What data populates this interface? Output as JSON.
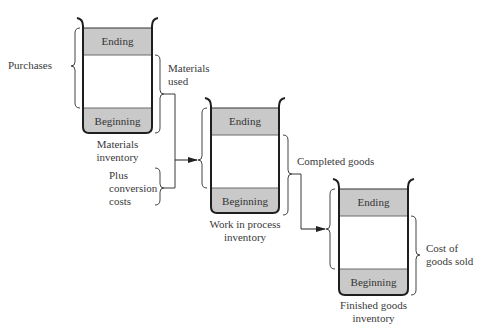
{
  "diagram": {
    "colors": {
      "band_fill": "#c9c9c9",
      "band_line": "#6a6a6a",
      "wall": "#1e1e1e",
      "line": "#3a3a3a",
      "text": "#3a3a3a"
    },
    "containers": [
      {
        "id": "materials",
        "top_band": "Ending",
        "bottom_band": "Beginning",
        "caption_line1": "Materials",
        "caption_line2": "inventory"
      },
      {
        "id": "wip",
        "top_band": "Ending",
        "bottom_band": "Beginning",
        "caption_line1": "Work in process",
        "caption_line2": "inventory"
      },
      {
        "id": "finished",
        "top_band": "Ending",
        "bottom_band": "Beginning",
        "caption_line1": "Finished goods",
        "caption_line2": "inventory"
      }
    ],
    "annotations": {
      "purchases": "Purchases",
      "materials_used_line1": "Materials",
      "materials_used_line2": "used",
      "plus_line1": "Plus",
      "plus_line2": "conversion",
      "plus_line3": "costs",
      "completed_goods": "Completed goods",
      "cogs_line1": "Cost of",
      "cogs_line2": "goods sold"
    }
  }
}
